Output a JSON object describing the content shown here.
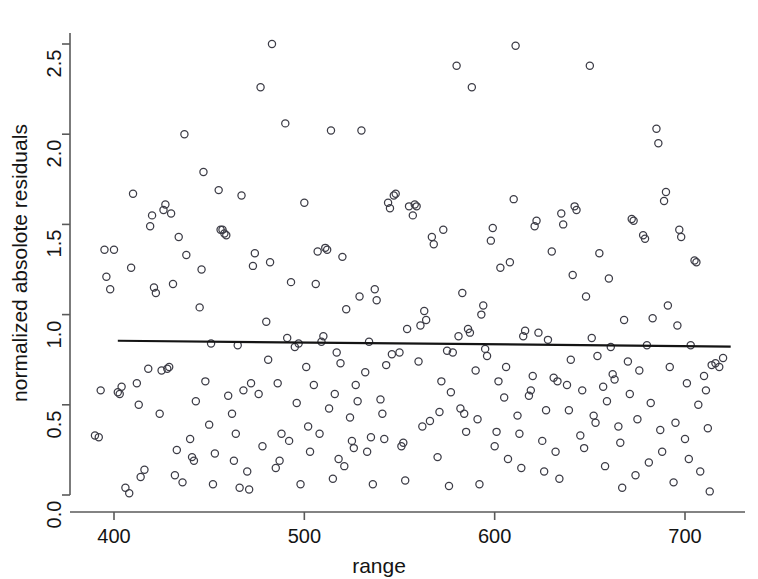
{
  "chart_data": {
    "type": "scatter",
    "title": "",
    "xlabel": "range",
    "ylabel": "normalized absolote residuals",
    "xlim": [
      388,
      722
    ],
    "ylim": [
      -0.02,
      2.52
    ],
    "xticks": [
      400,
      500,
      600,
      700
    ],
    "xtick_labels": [
      "400",
      "500",
      "600",
      "700"
    ],
    "yticks": [
      0.0,
      0.5,
      1.0,
      1.5,
      2.0,
      2.5
    ],
    "ytick_labels": [
      "0.0",
      "0.5",
      "1.0",
      "1.5",
      "2.0",
      "2.5"
    ],
    "grid": false,
    "legend": false,
    "marker": "open-circle",
    "marker_color": "#3c3c46",
    "marker_radius": 3.6,
    "series": [
      {
        "name": "normalized absolute residuals",
        "points": [
          [
            390,
            0.33
          ],
          [
            392,
            0.32
          ],
          [
            393,
            0.58
          ],
          [
            395,
            1.36
          ],
          [
            396,
            1.21
          ],
          [
            398,
            1.14
          ],
          [
            400,
            1.36
          ],
          [
            402,
            0.57
          ],
          [
            403,
            0.56
          ],
          [
            404,
            0.6
          ],
          [
            406,
            0.04
          ],
          [
            408,
            0.01
          ],
          [
            409,
            1.26
          ],
          [
            410,
            1.67
          ],
          [
            412,
            0.62
          ],
          [
            413,
            0.5
          ],
          [
            414,
            0.1
          ],
          [
            416,
            0.14
          ],
          [
            418,
            0.7
          ],
          [
            419,
            1.49
          ],
          [
            420,
            1.55
          ],
          [
            421,
            1.15
          ],
          [
            422,
            1.12
          ],
          [
            424,
            0.45
          ],
          [
            425,
            0.69
          ],
          [
            426,
            1.58
          ],
          [
            427,
            1.61
          ],
          [
            428,
            0.7
          ],
          [
            429,
            0.71
          ],
          [
            430,
            1.56
          ],
          [
            431,
            1.17
          ],
          [
            432,
            0.11
          ],
          [
            433,
            0.25
          ],
          [
            434,
            1.43
          ],
          [
            436,
            0.07
          ],
          [
            437,
            2.0
          ],
          [
            438,
            1.33
          ],
          [
            440,
            0.31
          ],
          [
            441,
            0.21
          ],
          [
            442,
            0.19
          ],
          [
            443,
            0.52
          ],
          [
            445,
            1.04
          ],
          [
            446,
            1.25
          ],
          [
            447,
            1.79
          ],
          [
            448,
            0.63
          ],
          [
            450,
            0.39
          ],
          [
            451,
            0.84
          ],
          [
            452,
            0.06
          ],
          [
            453,
            0.23
          ],
          [
            455,
            1.69
          ],
          [
            456,
            1.47
          ],
          [
            457,
            1.47
          ],
          [
            458,
            1.45
          ],
          [
            459,
            1.44
          ],
          [
            460,
            0.55
          ],
          [
            462,
            0.45
          ],
          [
            463,
            0.19
          ],
          [
            464,
            0.34
          ],
          [
            465,
            0.83
          ],
          [
            466,
            0.04
          ],
          [
            467,
            1.66
          ],
          [
            468,
            0.58
          ],
          [
            470,
            0.13
          ],
          [
            471,
            0.03
          ],
          [
            472,
            0.62
          ],
          [
            473,
            1.27
          ],
          [
            474,
            1.34
          ],
          [
            476,
            0.56
          ],
          [
            477,
            2.26
          ],
          [
            478,
            0.27
          ],
          [
            480,
            0.96
          ],
          [
            481,
            0.75
          ],
          [
            482,
            1.29
          ],
          [
            483,
            2.5
          ],
          [
            485,
            0.15
          ],
          [
            486,
            0.62
          ],
          [
            487,
            0.19
          ],
          [
            488,
            0.34
          ],
          [
            490,
            2.06
          ],
          [
            491,
            0.87
          ],
          [
            492,
            0.3
          ],
          [
            493,
            1.18
          ],
          [
            495,
            0.82
          ],
          [
            496,
            0.51
          ],
          [
            497,
            0.84
          ],
          [
            498,
            0.06
          ],
          [
            500,
            1.62
          ],
          [
            501,
            0.71
          ],
          [
            502,
            0.38
          ],
          [
            503,
            0.24
          ],
          [
            505,
            0.61
          ],
          [
            506,
            1.17
          ],
          [
            507,
            1.35
          ],
          [
            508,
            0.34
          ],
          [
            509,
            0.85
          ],
          [
            510,
            0.88
          ],
          [
            511,
            1.37
          ],
          [
            512,
            1.36
          ],
          [
            513,
            0.48
          ],
          [
            514,
            2.02
          ],
          [
            515,
            0.09
          ],
          [
            516,
            0.56
          ],
          [
            517,
            0.79
          ],
          [
            518,
            0.2
          ],
          [
            519,
            0.73
          ],
          [
            520,
            1.32
          ],
          [
            521,
            0.16
          ],
          [
            522,
            1.03
          ],
          [
            524,
            0.43
          ],
          [
            525,
            0.3
          ],
          [
            526,
            0.26
          ],
          [
            527,
            0.61
          ],
          [
            528,
            0.52
          ],
          [
            529,
            1.1
          ],
          [
            530,
            2.02
          ],
          [
            532,
            0.68
          ],
          [
            533,
            0.24
          ],
          [
            534,
            0.85
          ],
          [
            535,
            0.32
          ],
          [
            536,
            0.06
          ],
          [
            537,
            1.14
          ],
          [
            538,
            1.08
          ],
          [
            540,
            0.53
          ],
          [
            541,
            0.45
          ],
          [
            542,
            0.31
          ],
          [
            543,
            0.72
          ],
          [
            544,
            1.62
          ],
          [
            545,
            1.59
          ],
          [
            546,
            0.78
          ],
          [
            547,
            1.66
          ],
          [
            548,
            1.67
          ],
          [
            550,
            0.79
          ],
          [
            551,
            0.27
          ],
          [
            552,
            0.29
          ],
          [
            553,
            0.08
          ],
          [
            554,
            0.92
          ],
          [
            555,
            1.6
          ],
          [
            557,
            1.55
          ],
          [
            558,
            1.61
          ],
          [
            559,
            1.6
          ],
          [
            560,
            0.74
          ],
          [
            561,
            0.94
          ],
          [
            562,
            0.38
          ],
          [
            563,
            1.02
          ],
          [
            564,
            0.97
          ],
          [
            566,
            0.41
          ],
          [
            567,
            1.43
          ],
          [
            568,
            1.39
          ],
          [
            570,
            0.21
          ],
          [
            571,
            0.46
          ],
          [
            572,
            0.63
          ],
          [
            573,
            1.47
          ],
          [
            575,
            0.8
          ],
          [
            576,
            0.05
          ],
          [
            577,
            0.57
          ],
          [
            578,
            0.79
          ],
          [
            580,
            2.38
          ],
          [
            581,
            0.88
          ],
          [
            582,
            0.48
          ],
          [
            583,
            1.12
          ],
          [
            584,
            0.45
          ],
          [
            585,
            0.35
          ],
          [
            586,
            0.92
          ],
          [
            587,
            0.9
          ],
          [
            588,
            2.26
          ],
          [
            590,
            0.69
          ],
          [
            591,
            0.42
          ],
          [
            592,
            0.06
          ],
          [
            593,
            1.0
          ],
          [
            594,
            1.05
          ],
          [
            595,
            0.81
          ],
          [
            596,
            0.77
          ],
          [
            598,
            1.41
          ],
          [
            599,
            1.48
          ],
          [
            600,
            0.27
          ],
          [
            601,
            0.35
          ],
          [
            602,
            0.63
          ],
          [
            603,
            1.26
          ],
          [
            605,
            0.54
          ],
          [
            606,
            0.71
          ],
          [
            607,
            0.2
          ],
          [
            608,
            1.29
          ],
          [
            610,
            1.64
          ],
          [
            611,
            2.49
          ],
          [
            612,
            0.44
          ],
          [
            613,
            0.34
          ],
          [
            614,
            0.15
          ],
          [
            615,
            0.88
          ],
          [
            616,
            0.91
          ],
          [
            618,
            0.55
          ],
          [
            619,
            0.58
          ],
          [
            620,
            0.66
          ],
          [
            621,
            1.49
          ],
          [
            622,
            1.52
          ],
          [
            623,
            0.9
          ],
          [
            625,
            0.3
          ],
          [
            626,
            0.13
          ],
          [
            627,
            0.47
          ],
          [
            628,
            0.86
          ],
          [
            630,
            1.35
          ],
          [
            631,
            0.65
          ],
          [
            632,
            0.24
          ],
          [
            633,
            0.63
          ],
          [
            634,
            0.09
          ],
          [
            635,
            1.56
          ],
          [
            636,
            1.5
          ],
          [
            638,
            0.61
          ],
          [
            639,
            0.47
          ],
          [
            640,
            0.75
          ],
          [
            641,
            1.22
          ],
          [
            642,
            1.6
          ],
          [
            643,
            1.58
          ],
          [
            645,
            0.33
          ],
          [
            646,
            0.58
          ],
          [
            647,
            0.26
          ],
          [
            648,
            1.1
          ],
          [
            650,
            2.38
          ],
          [
            651,
            0.87
          ],
          [
            652,
            0.44
          ],
          [
            653,
            0.4
          ],
          [
            654,
            0.77
          ],
          [
            655,
            1.34
          ],
          [
            657,
            0.6
          ],
          [
            658,
            0.16
          ],
          [
            659,
            0.52
          ],
          [
            660,
            1.2
          ],
          [
            661,
            0.82
          ],
          [
            662,
            0.67
          ],
          [
            663,
            0.64
          ],
          [
            665,
            0.38
          ],
          [
            666,
            0.29
          ],
          [
            667,
            0.04
          ],
          [
            668,
            0.97
          ],
          [
            670,
            0.74
          ],
          [
            671,
            0.56
          ],
          [
            672,
            1.53
          ],
          [
            673,
            1.52
          ],
          [
            674,
            0.11
          ],
          [
            675,
            0.42
          ],
          [
            676,
            0.69
          ],
          [
            678,
            1.44
          ],
          [
            679,
            1.42
          ],
          [
            680,
            0.83
          ],
          [
            681,
            0.18
          ],
          [
            682,
            0.51
          ],
          [
            683,
            0.98
          ],
          [
            685,
            2.03
          ],
          [
            686,
            1.95
          ],
          [
            687,
            0.36
          ],
          [
            688,
            0.24
          ],
          [
            689,
            1.63
          ],
          [
            690,
            1.68
          ],
          [
            691,
            1.05
          ],
          [
            692,
            0.71
          ],
          [
            694,
            0.07
          ],
          [
            695,
            0.4
          ],
          [
            696,
            0.94
          ],
          [
            697,
            1.47
          ],
          [
            698,
            1.43
          ],
          [
            700,
            0.31
          ],
          [
            701,
            0.62
          ],
          [
            702,
            0.2
          ],
          [
            703,
            0.83
          ],
          [
            705,
            1.3
          ],
          [
            706,
            1.29
          ],
          [
            707,
            0.5
          ],
          [
            708,
            0.13
          ],
          [
            710,
            0.66
          ],
          [
            711,
            0.58
          ],
          [
            712,
            0.37
          ],
          [
            713,
            0.02
          ],
          [
            714,
            0.72
          ],
          [
            716,
            0.73
          ],
          [
            718,
            0.71
          ],
          [
            720,
            0.76
          ]
        ]
      }
    ],
    "trend_line": {
      "name": "regression-line",
      "color": "#141414",
      "width": 2.2,
      "x_start": 402,
      "y_start": 0.855,
      "x_end": 724,
      "y_end": 0.823
    }
  },
  "axes": {
    "x_axis_label": "range",
    "y_axis_label": "normalized absolote residuals",
    "x_tick_labels": [
      "400",
      "500",
      "600",
      "700"
    ],
    "y_tick_labels": [
      "0.0",
      "0.5",
      "1.0",
      "1.5",
      "2.0",
      "2.5"
    ]
  },
  "colors": {
    "background": "#ffffff",
    "axis": "#5a5a5a",
    "text": "#141414",
    "marker": "#3c3c46",
    "line": "#141414"
  }
}
